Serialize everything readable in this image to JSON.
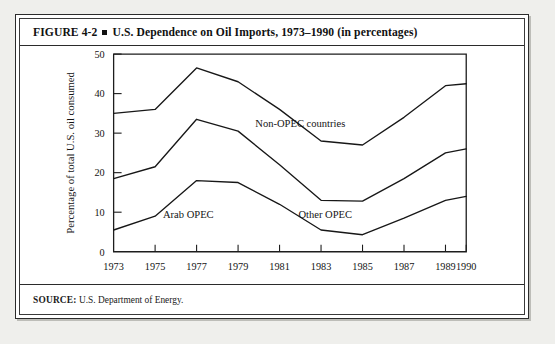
{
  "figure": {
    "number": "FIGURE 4-2",
    "title": "U.S. Dependence on Oil Imports, 1973–1990 (in percentages)",
    "source_label": "SOURCE:",
    "source_text": "U.S. Department of Energy."
  },
  "chart_data": {
    "type": "line",
    "title": "U.S. Dependence on Oil Imports, 1973–1990 (in percentages)",
    "xlabel": "",
    "ylabel": "Percentage of total U.S. oil consumed",
    "x": [
      1973,
      1975,
      1977,
      1979,
      1981,
      1983,
      1985,
      1987,
      1989,
      1990
    ],
    "xtick_labels": [
      "1973",
      "1975",
      "1977",
      "1979",
      "1981",
      "1983",
      "1985",
      "1987",
      "1989",
      "1990"
    ],
    "ytick_labels": [
      "0",
      "10",
      "20",
      "30",
      "40",
      "50"
    ],
    "yticks": [
      0,
      10,
      20,
      30,
      40,
      50
    ],
    "ylim": [
      0,
      50
    ],
    "xlim": [
      1973,
      1990
    ],
    "grid": false,
    "legend": "inline-annotations",
    "stacked": true,
    "series": [
      {
        "name": "Total imports (top boundary — Non-OPEC countries)",
        "label": "Non-OPEC countries",
        "values": [
          35,
          36,
          46.5,
          43,
          36,
          28,
          27,
          34,
          42,
          42.5
        ]
      },
      {
        "name": "OPEC total (middle boundary — Other OPEC)",
        "label": "Other OPEC",
        "values": [
          18.5,
          21.5,
          33.5,
          30.5,
          22,
          13,
          12.8,
          18.5,
          25,
          26
        ]
      },
      {
        "name": "Arab OPEC (lower boundary)",
        "label": "Arab OPEC",
        "values": [
          5.5,
          9,
          18,
          17.5,
          12,
          5.5,
          4.3,
          8.5,
          13,
          14
        ]
      }
    ],
    "annotations": [
      {
        "text": "Non-OPEC countries",
        "x": 1982.0,
        "y": 31.5
      },
      {
        "text": "Arab OPEC",
        "x": 1976.6,
        "y": 8.6
      },
      {
        "text": "Other OPEC",
        "x": 1983.2,
        "y": 8.6
      }
    ]
  }
}
